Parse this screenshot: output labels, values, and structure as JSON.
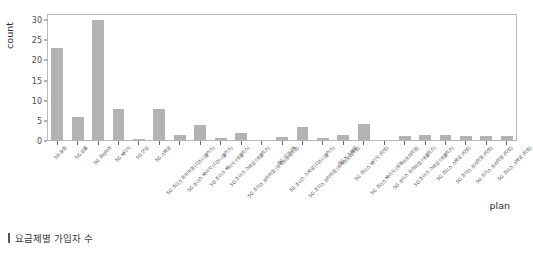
{
  "caption": {
    "marker": "",
    "text": "요금제별 가입자 수"
  },
  "axis": {
    "y_title": "count",
    "x_title": "plan",
    "y_ticks": [
      "0",
      "5",
      "10",
      "15",
      "20",
      "25",
      "30"
    ]
  },
  "chart_data": {
    "type": "bar",
    "title": "",
    "xlabel": "plan",
    "ylabel": "count",
    "ylim": [
      0,
      31.5
    ],
    "grid": false,
    "legend": "none",
    "bar_color": "#b3b3b3",
    "categories": [
      "5G 슬림",
      "5G 심플",
      "5G 프리미어",
      "5G 베이직",
      "5G 안심",
      "5G 스페셜",
      "5G 초이스 프리미엄 (디즈니플러스)",
      "5G 초이스 베이직 (디즈니플러스)",
      "5G 초이스 베이직 (넷플릭스)",
      "5G 초이스 스페셜 (넷플릭스)",
      "5G 초이스 프리미엄 (유튜브프리미엄)",
      "5G 시그니처",
      "5G 초이스 스페셜 (디즈니플러스)",
      "5G 초이스 프리미엄 (유튜브프리미엄)",
      "5G Y 스페셜",
      "5G 초이스 베이직 (티빙)",
      "5G 초이스 베이직 (유튜브프리미엄)",
      "5G 초이스 프리미엄 (넷플릭스)",
      "5G 초이스 스페셜 (넷플릭스)",
      "5G 초이스 스페셜 (티빙)",
      "5G 초이스 프리미엄 (티빙)",
      "5G 초이스 프리미엄 (티빙)",
      "5G 초이스 스페셜 (티빙)"
    ],
    "values": [
      23,
      6,
      30,
      8,
      0.6,
      8,
      1.4,
      4,
      0.7,
      2,
      0,
      1,
      3.6,
      0.7,
      1.6,
      4.2,
      0,
      1.2,
      1.4,
      1.6,
      1.3,
      1.2,
      1.2
    ]
  }
}
